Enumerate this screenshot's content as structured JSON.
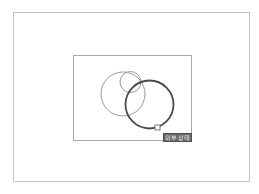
{
  "diagram": {
    "outer_frame": {
      "x": 13,
      "y": 12,
      "width": 237,
      "height": 170,
      "stroke": "#c4c4c4"
    },
    "inner_frame": {
      "x": 73,
      "y": 55,
      "width": 119,
      "height": 86,
      "stroke": "#a8a8a8"
    },
    "circles": [
      {
        "name": "medium-light-circle",
        "cx": 123,
        "cy": 94,
        "r": 22,
        "stroke": "#9a9a9a",
        "stroke_width": 1
      },
      {
        "name": "small-light-circle",
        "cx": 130.5,
        "cy": 82,
        "r": 10.5,
        "stroke": "#9a9a9a",
        "stroke_width": 1
      },
      {
        "name": "large-dark-circle",
        "cx": 149.5,
        "cy": 104.5,
        "r": 24,
        "stroke": "#4a4a4a",
        "stroke_width": 1.8
      }
    ],
    "handle": {
      "x": 155,
      "y": 125,
      "size": 5,
      "stroke": "#5a5a5a"
    },
    "label": {
      "text": "외부 상태",
      "background": "#6a6a6a",
      "color": "#e8e8e8"
    }
  }
}
